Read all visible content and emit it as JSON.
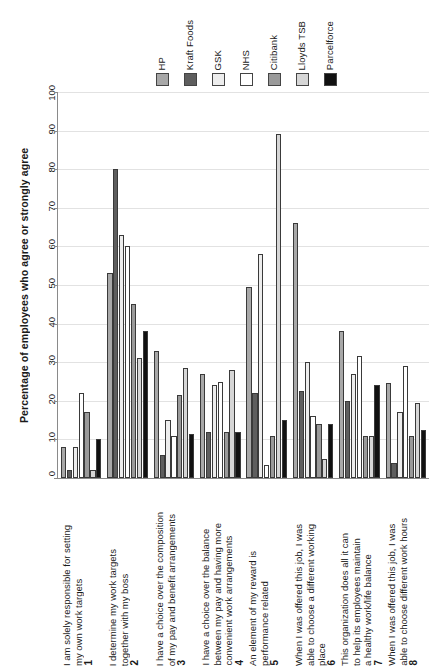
{
  "chart_data": {
    "type": "bar",
    "title": "",
    "xlabel": "",
    "ylabel": "Percentage of employees who agree or strongly agree",
    "ylim": [
      0,
      100
    ],
    "ytick_labels": [
      "0",
      "10",
      "20",
      "30",
      "40",
      "50",
      "60",
      "70",
      "80",
      "90",
      "100"
    ],
    "grid": true,
    "legend_position": "top",
    "categories": [
      "1 I am solely responsible for setting my own work targets",
      "2 I determine my work targets together with my boss",
      "3 I have a choice over the composition of my pay and benefit arrangements",
      "4 I have a choice over the balance between my pay and having more convenient work arrangements",
      "5 An element of my reward is performance related",
      "6 When I was offered this job, I was able to choose a different working place",
      "7 This organization does all it can to help its employees maintain a healthy work/life balance",
      "8 When I was offered this job, I was able to choose different work hours"
    ],
    "category_numbers": [
      "1",
      "2",
      "3",
      "4",
      "5",
      "6",
      "7",
      "8"
    ],
    "category_texts": [
      "I am solely responsible for setting\nmy own work targets",
      "I determine my work targets\ntogether with my boss",
      "I have a choice over the composition\nof my pay and benefit arrangements",
      "I have a choice over the balance\nbetween my pay and having more\nconvenient work arrangements",
      "An element of my reward is\nperformance related",
      "When I was offered this job, I was\nable to choose a different working\nplace",
      "This organization does all it can\nto help its employees maintain\na healthy work/life balance",
      "When I was offered this job, I was\nable to choose different work hours"
    ],
    "series": [
      {
        "name": "HP",
        "color": "#a8a8a8",
        "values": [
          8,
          53,
          33,
          27,
          49.5,
          66,
          38,
          24.5
        ]
      },
      {
        "name": "Kraft Foods",
        "color": "#5e5e5e",
        "values": [
          2,
          80,
          6,
          12,
          22,
          22.5,
          20,
          4
        ]
      },
      {
        "name": "GSK",
        "color": "#ededed",
        "values": [
          8,
          63,
          15,
          24,
          58,
          30,
          27,
          17
        ]
      },
      {
        "name": "NHS",
        "color": "#ffffff",
        "values": [
          22,
          60,
          11,
          25,
          3.5,
          16,
          31.5,
          29
        ]
      },
      {
        "name": "Citibank",
        "color": "#9a9a9a",
        "values": [
          17,
          45,
          21.5,
          12,
          11,
          14,
          11,
          11
        ]
      },
      {
        "name": "Lloyds TSB",
        "color": "#d6d6d6",
        "values": [
          2,
          31,
          28.5,
          28,
          89,
          5,
          11,
          19.5
        ]
      },
      {
        "name": "Parcelforce",
        "color": "#111111",
        "values": [
          10,
          38,
          11.5,
          12,
          15,
          14,
          24,
          12.5
        ]
      }
    ]
  }
}
